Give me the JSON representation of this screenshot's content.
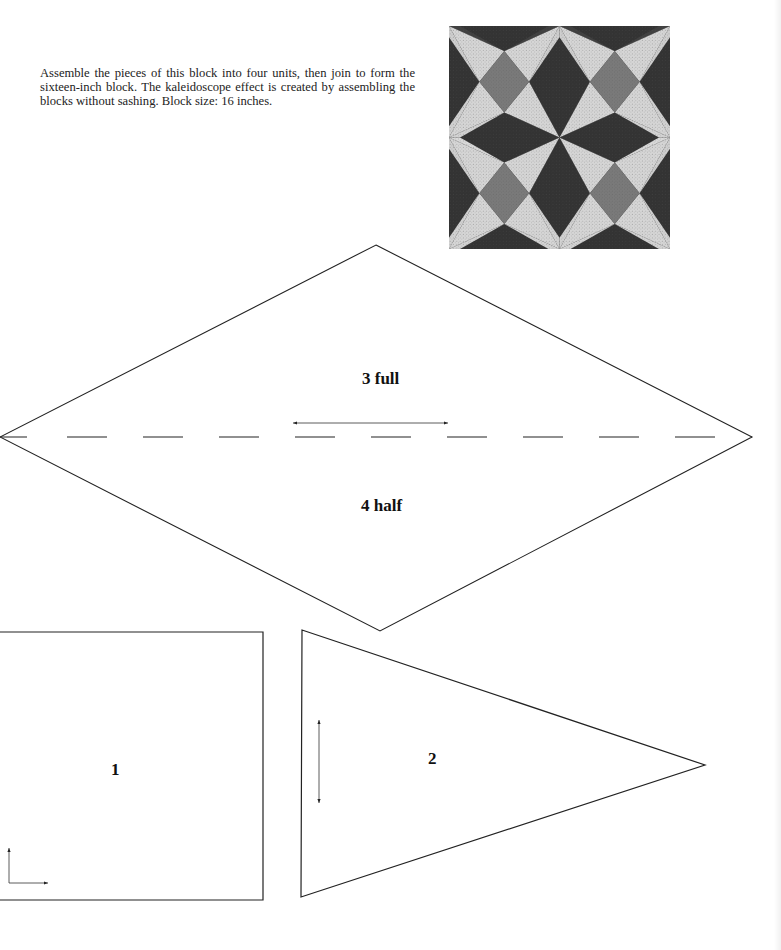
{
  "intro_text": "Assemble the pieces of this block into four units, then join to form the sixteen-inch block. The kaleidoscope effect is created by assembling the blocks without sashing. Block size: 16 inches.",
  "quilt_photo": {
    "alt": "Kaleidoscope quilt block photo",
    "colors": {
      "dark": "#333333",
      "light": "#d9d9d9",
      "medium": "#7a7a7a"
    }
  },
  "pattern_pieces": [
    {
      "id": "diamond-top",
      "label": "3 full"
    },
    {
      "id": "diamond-bottom",
      "label": "4 half"
    },
    {
      "id": "square",
      "label": "1"
    },
    {
      "id": "triangle",
      "label": "2"
    }
  ],
  "grain_arrows": [
    {
      "piece": "diamond",
      "direction": "horizontal-double"
    },
    {
      "piece": "square",
      "direction": "corner-L"
    },
    {
      "piece": "triangle",
      "direction": "vertical-double"
    }
  ]
}
